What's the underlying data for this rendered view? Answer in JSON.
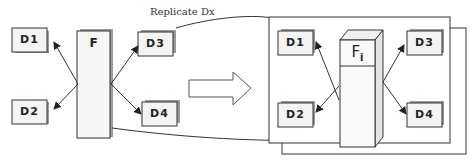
{
  "diagram": {
    "left": {
      "fragment_label": "F",
      "datanodes": [
        {
          "id": "d1",
          "label": "D1"
        },
        {
          "id": "d2",
          "label": "D2"
        },
        {
          "id": "d3",
          "label": "D3"
        },
        {
          "id": "d4",
          "label": "D4"
        }
      ]
    },
    "transform_arrow": "right-block-arrow",
    "edge_label": "Replicate Dx",
    "right": {
      "fragment_label": "F",
      "fragment_subscript": "i",
      "datanodes": [
        {
          "id": "d1",
          "label": "D1"
        },
        {
          "id": "d2",
          "label": "D2"
        },
        {
          "id": "d3",
          "label": "D3"
        },
        {
          "id": "d4",
          "label": "D4"
        }
      ],
      "stacked_frames": 2
    },
    "colors": {
      "stroke": "#333333",
      "box_fill": "#f4f4f4",
      "box_shadow": "#9a9a9a",
      "background": "#ffffff"
    }
  }
}
